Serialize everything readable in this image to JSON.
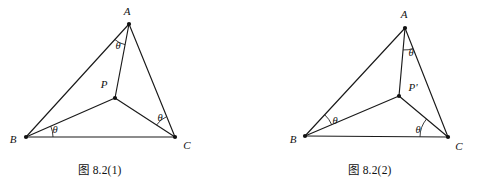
{
  "figure": {
    "title": "图 8.2",
    "background_color": "#ffffff",
    "line_color": "#1a1a1a",
    "panels": [
      {
        "id": "panel-1",
        "caption": "图 8.2(1)",
        "caption_x": 100,
        "caption_y": 169,
        "vertices": [
          {
            "name": "A",
            "label": "A",
            "x": 129,
            "y": 24,
            "label_x": 127,
            "label_y": 11
          },
          {
            "name": "B",
            "label": "B",
            "x": 26,
            "y": 137,
            "label_x": 13,
            "label_y": 139
          },
          {
            "name": "C",
            "label": "C",
            "x": 175,
            "y": 137,
            "label_x": 187,
            "label_y": 145
          },
          {
            "name": "P",
            "label": "P",
            "x": 115,
            "y": 98,
            "label_x": 104,
            "label_y": 84
          }
        ],
        "edges": [
          {
            "name": "side-AB",
            "from": "A",
            "to": "B"
          },
          {
            "name": "side-BC",
            "from": "B",
            "to": "C"
          },
          {
            "name": "side-CA",
            "from": "C",
            "to": "A"
          }
        ],
        "cevians": [
          {
            "name": "segment-PA",
            "from": "P",
            "to": "A"
          },
          {
            "name": "segment-PB",
            "from": "P",
            "to": "B"
          },
          {
            "name": "segment-PC",
            "from": "P",
            "to": "C"
          }
        ],
        "angles": [
          {
            "name": "angle-at-A",
            "vertex": "A",
            "from": "B",
            "to": "P",
            "label": "θ",
            "radius": 21,
            "label_x": 118,
            "label_y": 46
          },
          {
            "name": "angle-at-B",
            "vertex": "B",
            "from": "C",
            "to": "P",
            "label": "θ",
            "radius": 27,
            "label_x": 55,
            "label_y": 130
          },
          {
            "name": "angle-at-C",
            "vertex": "C",
            "from": "P",
            "to": "A",
            "label": "θ",
            "radius": 22,
            "label_x": 160,
            "label_y": 118
          }
        ]
      },
      {
        "id": "panel-2",
        "caption": "图 8.2(2)",
        "caption_x": 370,
        "caption_y": 169,
        "vertices": [
          {
            "name": "A",
            "label": "A",
            "x": 405,
            "y": 28,
            "label_x": 404,
            "label_y": 14
          },
          {
            "name": "B",
            "label": "B",
            "x": 305,
            "y": 136,
            "label_x": 293,
            "label_y": 139
          },
          {
            "name": "C",
            "label": "C",
            "x": 448,
            "y": 137,
            "label_x": 459,
            "label_y": 146
          },
          {
            "name": "P",
            "label": "P'",
            "x": 399,
            "y": 96,
            "label_x": 413,
            "label_y": 87
          }
        ],
        "edges": [
          {
            "name": "side-AB",
            "from": "A",
            "to": "B"
          },
          {
            "name": "side-BC",
            "from": "B",
            "to": "C"
          },
          {
            "name": "side-CA",
            "from": "C",
            "to": "A"
          }
        ],
        "cevians": [
          {
            "name": "segment-PA",
            "from": "P",
            "to": "A"
          },
          {
            "name": "segment-PB",
            "from": "P",
            "to": "B"
          },
          {
            "name": "segment-PC",
            "from": "P",
            "to": "C"
          }
        ],
        "angles": [
          {
            "name": "angle-at-A",
            "vertex": "A",
            "from": "P",
            "to": "C",
            "label": "θ",
            "radius": 22,
            "label_x": 411,
            "label_y": 53
          },
          {
            "name": "angle-at-B",
            "vertex": "B",
            "from": "P",
            "to": "A",
            "label": "θ",
            "radius": 29,
            "label_x": 335,
            "label_y": 121
          },
          {
            "name": "angle-at-C",
            "vertex": "C",
            "from": "B",
            "to": "P",
            "label": "θ",
            "radius": 28,
            "label_x": 418,
            "label_y": 130
          }
        ]
      }
    ]
  }
}
